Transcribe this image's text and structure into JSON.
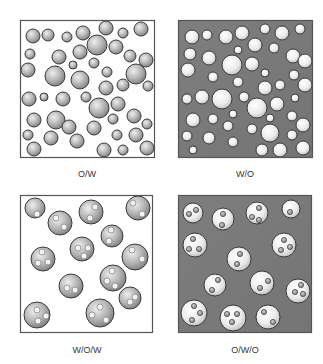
{
  "figure": {
    "width": 323,
    "height": 364,
    "colors": {
      "light_background": "#ffffff",
      "dark_background": "#7a7a7a",
      "frame": "#555555",
      "droplet_outline": "#3a3a3a",
      "gray_droplet_light": "#e6e6e6",
      "gray_droplet_dark": "#8a8a8a",
      "white_droplet_light": "#ffffff",
      "white_droplet_dark": "#c8c8c8"
    }
  },
  "panels": [
    {
      "id": "ow",
      "label": "O/W",
      "x": 20,
      "y": 20,
      "w": 135,
      "h": 138,
      "background": "light",
      "label_x": 87,
      "label_y": 177,
      "droplet_style": "gray",
      "droplets": [
        [
          33,
          36,
          7
        ],
        [
          48,
          35,
          6
        ],
        [
          67,
          37,
          5
        ],
        [
          83,
          33,
          7
        ],
        [
          106,
          28,
          7
        ],
        [
          123,
          33,
          5
        ],
        [
          141,
          29,
          7
        ],
        [
          30,
          54,
          5
        ],
        [
          59,
          57,
          7
        ],
        [
          80,
          52,
          7
        ],
        [
          97,
          45,
          10
        ],
        [
          116,
          47,
          7
        ],
        [
          130,
          56,
          6
        ],
        [
          146,
          60,
          7
        ],
        [
          28,
          70,
          7
        ],
        [
          55,
          76,
          10
        ],
        [
          73,
          65,
          4
        ],
        [
          94,
          63,
          5
        ],
        [
          107,
          72,
          5
        ],
        [
          136,
          74,
          10
        ],
        [
          148,
          86,
          5
        ],
        [
          80,
          80,
          9
        ],
        [
          106,
          88,
          7
        ],
        [
          123,
          85,
          6
        ],
        [
          29,
          99,
          7
        ],
        [
          44,
          97,
          4
        ],
        [
          63,
          99,
          7
        ],
        [
          86,
          97,
          5
        ],
        [
          99,
          108,
          10
        ],
        [
          118,
          104,
          7
        ],
        [
          34,
          120,
          7
        ],
        [
          56,
          120,
          9
        ],
        [
          69,
          127,
          7
        ],
        [
          113,
          119,
          5
        ],
        [
          134,
          116,
          7
        ],
        [
          147,
          124,
          5
        ],
        [
          28,
          135,
          5
        ],
        [
          51,
          138,
          7
        ],
        [
          77,
          141,
          7
        ],
        [
          94,
          128,
          7
        ],
        [
          117,
          135,
          5
        ],
        [
          136,
          135,
          7
        ],
        [
          34,
          149,
          7
        ],
        [
          104,
          150,
          7
        ],
        [
          123,
          150,
          5
        ],
        [
          147,
          148,
          7
        ]
      ]
    },
    {
      "id": "wo",
      "label": "W/O",
      "x": 178,
      "y": 20,
      "w": 135,
      "h": 138,
      "background": "dark",
      "label_x": 245,
      "label_y": 177,
      "droplet_style": "white",
      "droplets": [
        [
          192,
          37,
          7
        ],
        [
          207,
          35,
          5
        ],
        [
          226,
          37,
          7
        ],
        [
          242,
          33,
          7
        ],
        [
          265,
          29,
          5
        ],
        [
          282,
          33,
          7
        ],
        [
          300,
          29,
          5
        ],
        [
          190,
          54,
          6
        ],
        [
          209,
          58,
          7
        ],
        [
          238,
          50,
          4
        ],
        [
          255,
          45,
          7
        ],
        [
          274,
          48,
          5
        ],
        [
          293,
          56,
          7
        ],
        [
          305,
          61,
          7
        ],
        [
          188,
          70,
          7
        ],
        [
          232,
          65,
          10
        ],
        [
          252,
          64,
          7
        ],
        [
          213,
          77,
          5
        ],
        [
          265,
          73,
          4
        ],
        [
          294,
          75,
          5
        ],
        [
          305,
          85,
          7
        ],
        [
          238,
          82,
          5
        ],
        [
          265,
          88,
          7
        ],
        [
          280,
          85,
          5
        ],
        [
          187,
          99,
          5
        ],
        [
          202,
          97,
          7
        ],
        [
          222,
          99,
          10
        ],
        [
          244,
          97,
          5
        ],
        [
          257,
          108,
          10
        ],
        [
          277,
          104,
          7
        ],
        [
          295,
          98,
          4
        ],
        [
          193,
          120,
          7
        ],
        [
          213,
          119,
          5
        ],
        [
          233,
          114,
          4
        ],
        [
          228,
          126,
          5
        ],
        [
          252,
          129,
          5
        ],
        [
          270,
          118,
          4
        ],
        [
          292,
          116,
          5
        ],
        [
          303,
          125,
          7
        ],
        [
          187,
          136,
          5
        ],
        [
          209,
          138,
          6
        ],
        [
          233,
          142,
          5
        ],
        [
          270,
          133,
          9
        ],
        [
          292,
          135,
          5
        ],
        [
          193,
          150,
          4
        ],
        [
          262,
          150,
          6
        ],
        [
          280,
          150,
          7
        ],
        [
          303,
          148,
          7
        ]
      ]
    },
    {
      "id": "wow",
      "label": "W/O/W",
      "x": 20,
      "y": 195,
      "w": 133,
      "h": 138,
      "background": "light",
      "label_x": 87,
      "label_y": 353,
      "droplet_style": "gray_with_inner",
      "droplets": [
        {
          "c": [
            35,
            208,
            10
          ],
          "inner": [
            [
              37,
              214,
              3
            ]
          ]
        },
        {
          "c": [
            60,
            223,
            12
          ],
          "inner": [
            [
              56,
              218,
              3
            ],
            [
              64,
              227,
              3
            ]
          ]
        },
        {
          "c": [
            91,
            212,
            12
          ],
          "inner": [
            [
              95,
              207,
              3
            ],
            [
              90,
              218,
              3
            ]
          ]
        },
        {
          "c": [
            138,
            208,
            12
          ],
          "inner": [
            [
              133,
              203,
              3
            ],
            [
              142,
              214,
              3
            ]
          ]
        },
        {
          "c": [
            112,
            236,
            11
          ],
          "inner": [
            [
              111,
              230,
              3
            ],
            [
              109,
              241,
              3
            ]
          ]
        },
        {
          "c": [
            82,
            249,
            12
          ],
          "inner": [
            [
              78,
              248,
              3
            ],
            [
              88,
              248,
              3
            ],
            [
              84,
              256,
              3
            ]
          ]
        },
        {
          "c": [
            43,
            259,
            12
          ],
          "inner": [
            [
              42,
              252,
              3
            ],
            [
              38,
              263,
              3
            ],
            [
              48,
              262,
              3
            ]
          ]
        },
        {
          "c": [
            135,
            257,
            13
          ],
          "inner": [
            [
              132,
              250,
              3
            ],
            [
              142,
              259,
              3
            ]
          ]
        },
        {
          "c": [
            71,
            286,
            12
          ],
          "inner": [
            [
              67,
              288,
              3
            ],
            [
              75,
              290,
              3
            ]
          ]
        },
        {
          "c": [
            113,
            278,
            13
          ],
          "inner": [
            [
              112,
              271,
              3
            ],
            [
              107,
              281,
              3
            ],
            [
              115,
              286,
              3
            ]
          ]
        },
        {
          "c": [
            130,
            298,
            11
          ],
          "inner": [
            [
              135,
              297,
              3
            ],
            [
              130,
              302,
              3
            ]
          ]
        },
        {
          "c": [
            37,
            315,
            13
          ],
          "inner": [
            [
              37,
              310,
              3
            ],
            [
              46,
              316,
              3
            ],
            [
              38,
              321,
              3
            ]
          ]
        },
        {
          "c": [
            100,
            313,
            14
          ],
          "inner": [
            [
              100,
              307,
              3
            ],
            [
              92,
              315,
              3
            ],
            [
              106,
              320,
              3
            ]
          ]
        }
      ]
    },
    {
      "id": "owo",
      "label": "O/W/O",
      "x": 178,
      "y": 195,
      "w": 134,
      "h": 138,
      "background": "dark",
      "label_x": 245,
      "label_y": 353,
      "droplet_style": "white_with_inner",
      "droplets": [
        {
          "c": [
            193,
            213,
            10
          ],
          "inner": [
            [
              189,
              214,
              2.6
            ],
            [
              196,
              210,
              2.6
            ]
          ]
        },
        {
          "c": [
            223,
            219,
            11
          ],
          "inner": [
            [
              223,
              214,
              2.6
            ],
            [
              222,
              225,
              2.6
            ]
          ]
        },
        {
          "c": [
            257,
            213,
            11
          ],
          "inner": [
            [
              259,
              208,
              2.6
            ],
            [
              252,
              217,
              2.6
            ],
            [
              259,
              220,
              2.6
            ]
          ]
        },
        {
          "c": [
            291,
            209,
            9
          ],
          "inner": [
            [
              290,
              212,
              2.6
            ]
          ]
        },
        {
          "c": [
            195,
            245,
            12
          ],
          "inner": [
            [
              193,
              239,
              2.6
            ],
            [
              189,
              249,
              2.6
            ],
            [
              199,
              249,
              2.6
            ]
          ]
        },
        {
          "c": [
            284,
            245,
            12
          ],
          "inner": [
            [
              284,
              240,
              2.6
            ],
            [
              281,
              250,
              2.6
            ],
            [
              290,
              247,
              2.6
            ]
          ]
        },
        {
          "c": [
            239,
            259,
            12
          ],
          "inner": [
            [
              240,
              254,
              2.6
            ],
            [
              237,
              264,
              2.6
            ]
          ]
        },
        {
          "c": [
            215,
            285,
            11
          ],
          "inner": [
            [
              218,
              280,
              2.6
            ],
            [
              212,
              290,
              2.6
            ]
          ]
        },
        {
          "c": [
            262,
            283,
            12
          ],
          "inner": [
            [
              268,
              281,
              2.6
            ],
            [
              260,
              288,
              2.6
            ]
          ]
        },
        {
          "c": [
            298,
            291,
            12
          ],
          "inner": [
            [
              301,
              285,
              2.6
            ],
            [
              295,
              292,
              2.6
            ],
            [
              303,
              294,
              2.6
            ]
          ]
        },
        {
          "c": [
            194,
            313,
            13
          ],
          "inner": [
            [
              194,
              306,
              2.6
            ],
            [
              200,
              313,
              2.6
            ],
            [
              192,
              320,
              2.6
            ]
          ]
        },
        {
          "c": [
            233,
            318,
            13
          ],
          "inner": [
            [
              227,
              314,
              2.6
            ],
            [
              237,
              314,
              2.6
            ],
            [
              232,
              322,
              2.6
            ]
          ]
        },
        {
          "c": [
            268,
            317,
            12
          ],
          "inner": [
            [
              264,
              312,
              2.6
            ],
            [
              273,
              322,
              2.6
            ]
          ]
        }
      ]
    }
  ]
}
